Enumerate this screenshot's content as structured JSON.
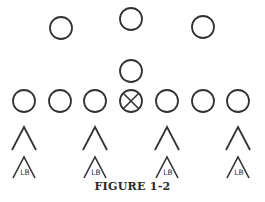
{
  "figure": {
    "caption": "FIGURE 1-2",
    "stroke_color": "#333333",
    "background": "#ffffff"
  },
  "offense": {
    "backfield": [
      {
        "role": "back",
        "x": 61,
        "y": 28
      },
      {
        "role": "back",
        "x": 131,
        "y": 19
      },
      {
        "role": "back",
        "x": 203,
        "y": 27
      },
      {
        "role": "quarterback",
        "x": 131,
        "y": 71
      }
    ],
    "line": [
      {
        "role": "lineman",
        "x": 24,
        "y": 101
      },
      {
        "role": "lineman",
        "x": 60,
        "y": 101
      },
      {
        "role": "lineman",
        "x": 95,
        "y": 101
      },
      {
        "role": "center",
        "x": 131,
        "y": 101,
        "marked": true
      },
      {
        "role": "lineman",
        "x": 167,
        "y": 101
      },
      {
        "role": "lineman",
        "x": 203,
        "y": 101
      },
      {
        "role": "lineman",
        "x": 238,
        "y": 101
      }
    ],
    "circle_radius": 11
  },
  "defense": {
    "linemen": [
      {
        "x": 24,
        "y": 138
      },
      {
        "x": 95,
        "y": 138
      },
      {
        "x": 167,
        "y": 138
      },
      {
        "x": 238,
        "y": 138
      }
    ],
    "linebackers": [
      {
        "label": "LB",
        "x": 24,
        "y": 168
      },
      {
        "label": "LB",
        "x": 95,
        "y": 168
      },
      {
        "label": "LB",
        "x": 167,
        "y": 168
      },
      {
        "label": "LB",
        "x": 238,
        "y": 168
      }
    ]
  }
}
